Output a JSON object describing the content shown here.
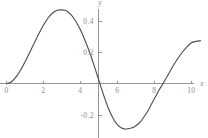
{
  "chart_data": {
    "type": "line",
    "title": "",
    "subtitle": "",
    "xlabel": "x",
    "ylabel": "y",
    "grid": false,
    "legend": false,
    "xlim": [
      -0.35,
      10.9
    ],
    "ylim": [
      -0.345,
      0.535
    ],
    "xticks": [
      0,
      2,
      4,
      6,
      8,
      10
    ],
    "xtick_labels": [
      "0",
      "2",
      "4",
      "6",
      "8",
      "10"
    ],
    "yticks": [
      0.4,
      0.2,
      -0.2
    ],
    "ytick_labels": [
      "0.4",
      "0.2",
      "-0.2"
    ],
    "y_axis_position_x": 5,
    "x_axis_position_y": 0,
    "series": [
      {
        "name": "curve",
        "color": "#4a4a4a",
        "x": [
          0.0,
          0.25,
          0.5,
          0.75,
          1.0,
          1.25,
          1.5,
          1.75,
          2.0,
          2.25,
          2.5,
          2.75,
          3.0,
          3.15,
          3.25,
          3.5,
          3.75,
          4.0,
          4.25,
          4.5,
          4.75,
          5.0,
          5.25,
          5.5,
          5.75,
          6.0,
          6.25,
          6.5,
          6.75,
          6.9,
          7.0,
          7.25,
          7.5,
          7.75,
          8.0,
          8.25,
          8.5,
          8.75,
          9.0,
          9.25,
          9.5,
          9.75,
          10.0,
          10.25,
          10.5
        ],
        "y": [
          0.0,
          0.012,
          0.042,
          0.086,
          0.14,
          0.199,
          0.26,
          0.32,
          0.374,
          0.42,
          0.452,
          0.47,
          0.472,
          0.47,
          0.465,
          0.44,
          0.4,
          0.345,
          0.277,
          0.2,
          0.113,
          0.022,
          -0.07,
          -0.152,
          -0.216,
          -0.26,
          -0.283,
          -0.288,
          -0.281,
          -0.275,
          -0.267,
          -0.24,
          -0.2,
          -0.15,
          -0.094,
          -0.04,
          0.009,
          0.06,
          0.112,
          0.159,
          0.2,
          0.235,
          0.262,
          0.272,
          0.275
        ]
      }
    ],
    "annotations": []
  },
  "axis_labels": {
    "x": "x",
    "y": "y"
  },
  "colors": {
    "background": "#ffffff",
    "axis": "#959595",
    "curve": "#4a4a4a",
    "tick_text": "#8a8a8a"
  }
}
